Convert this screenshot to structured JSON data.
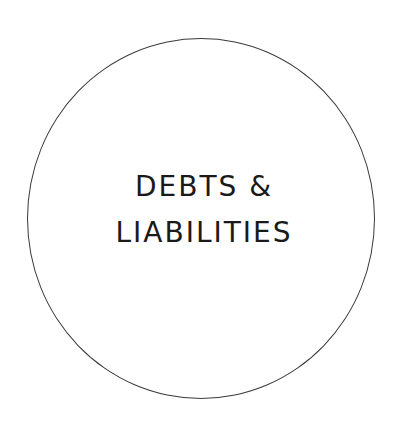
{
  "badge": {
    "lines": [
      "DEBTS &",
      "LIABILITIES"
    ],
    "text_color": "#1a1a1a",
    "border_color": "#3a3a3a",
    "background": "#ffffff"
  }
}
